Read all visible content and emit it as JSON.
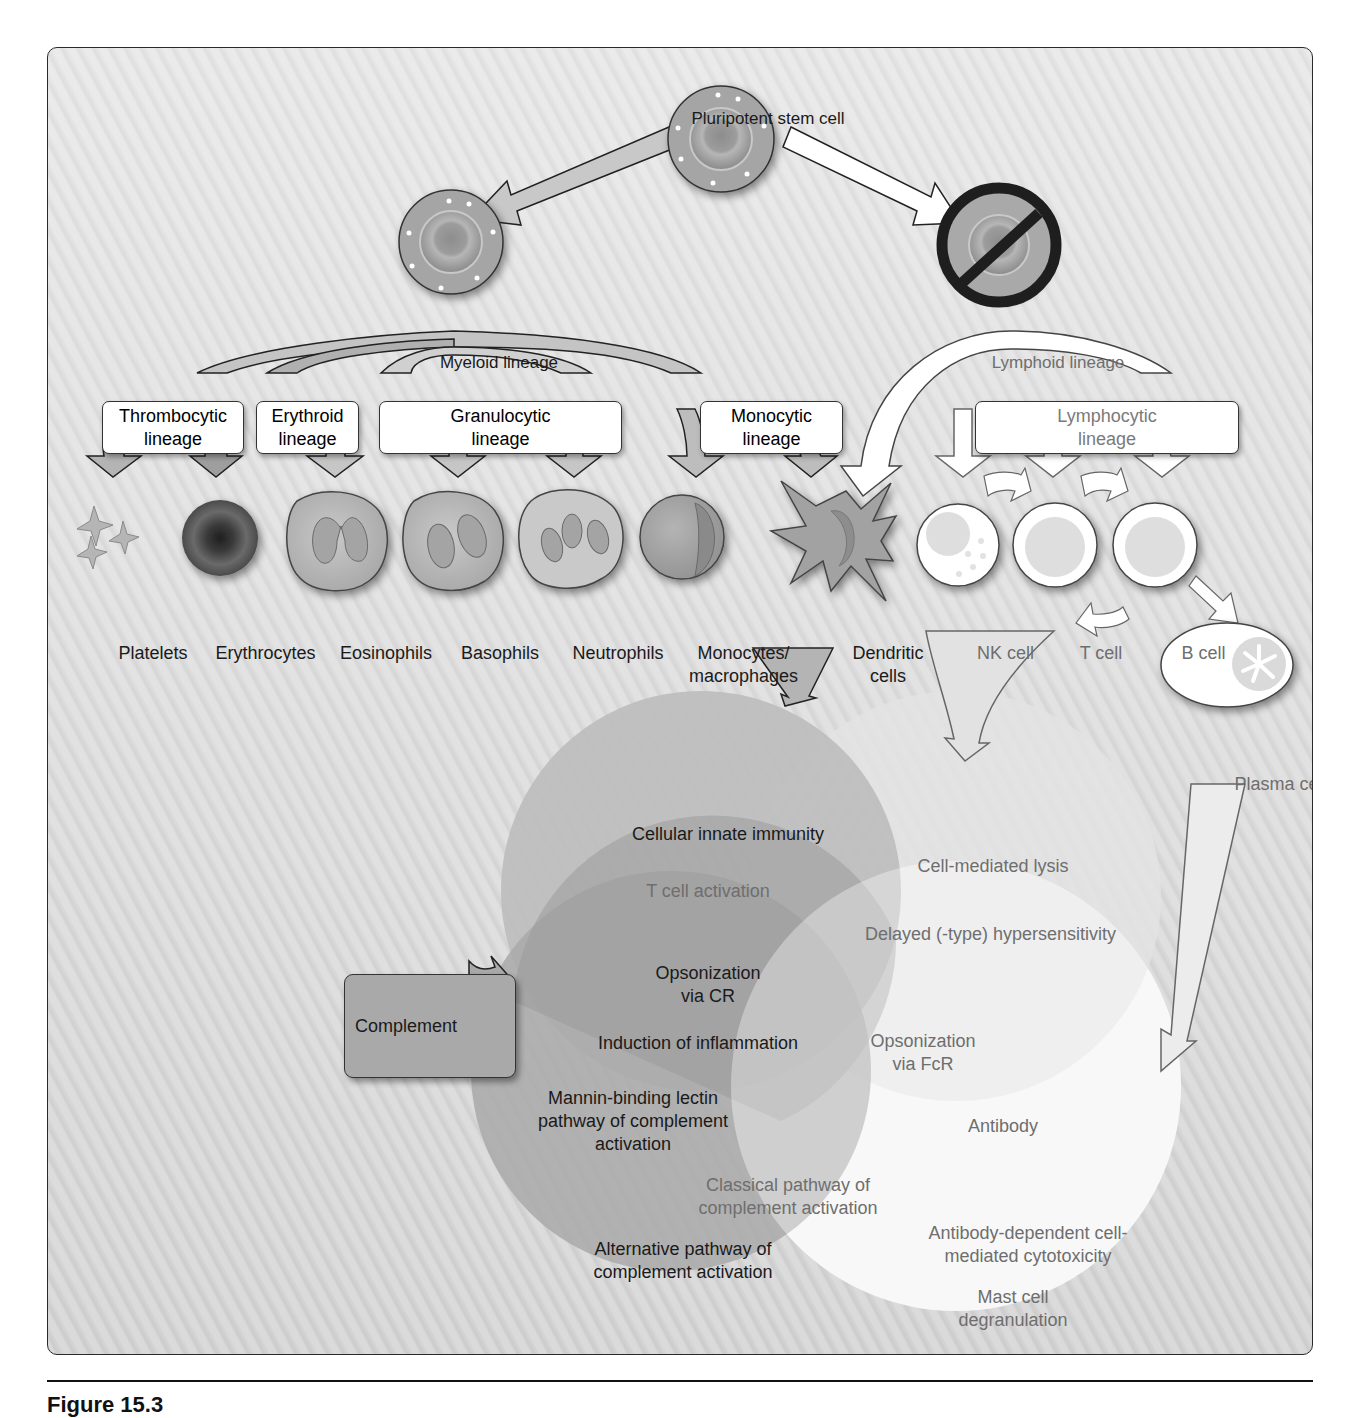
{
  "figure": {
    "caption_partial": "Figure 15.3"
  },
  "stem_cells": {
    "pluripotent": "Pluripotent stem cell",
    "myeloid": "Myeloid lineage",
    "lymphoid": "Lymphoid lineage",
    "lymphoid_blocked": true
  },
  "lineage_boxes": [
    {
      "label": "Thrombocytic\nlineage",
      "group": "myeloid"
    },
    {
      "label": "Erythroid\nlineage",
      "group": "myeloid"
    },
    {
      "label": "Granulocytic\nlineage",
      "group": "myeloid"
    },
    {
      "label": "Monocytic\nlineage",
      "group": "myeloid"
    },
    {
      "label": "Lymphocytic\nlineage",
      "group": "lymphoid"
    }
  ],
  "cells": [
    {
      "label": "Platelets",
      "group": "myeloid"
    },
    {
      "label": "Erythrocytes",
      "group": "myeloid"
    },
    {
      "label": "Eosinophils",
      "group": "myeloid"
    },
    {
      "label": "Basophils",
      "group": "myeloid"
    },
    {
      "label": "Neutrophils",
      "group": "myeloid"
    },
    {
      "label": "Monocytes/\nmacrophages",
      "group": "myeloid"
    },
    {
      "label": "Dendritic\ncells",
      "group": "myeloid"
    },
    {
      "label": "NK cell",
      "group": "lymphoid"
    },
    {
      "label": "T cell",
      "group": "lymphoid"
    },
    {
      "label": "B cell",
      "group": "lymphoid"
    },
    {
      "label": "Plasma cell",
      "group": "lymphoid"
    }
  ],
  "complement": {
    "label": "Complement"
  },
  "venn": {
    "innate_circle": {
      "title": "Cellular innate immunity",
      "items": [
        "T cell activation"
      ]
    },
    "cellular_adaptive_circle": {
      "items": [
        "Cell-mediated lysis",
        "Delayed (-type) hypersensitivity"
      ]
    },
    "complement_circle": {
      "items": [
        "Opsonization\nvia CR",
        "Induction of inflammation",
        "Mannin-binding lectin\npathway of complement\nactivation",
        "Alternative pathway of\ncomplement activation"
      ]
    },
    "humoral_circle": {
      "items": [
        "Opsonization\nvia FcR",
        "Antibody",
        "Classical pathway of\ncomplement activation",
        "Antibody-dependent cell-\nmediated cytotoxicity",
        "Mast cell\ndegranulation"
      ]
    }
  },
  "colors": {
    "panel_bg": "#dcdcdc",
    "innate_circle": "#bdbdbd",
    "complement_circle": "#a9a9a9",
    "overlap_dark": "#9a9a9a",
    "adaptive_cellular": "#e4e4e4",
    "humoral": "#f7f7f7",
    "arrow_myeloid": "#b8b8b8",
    "arrow_lymphoid": "#ffffff",
    "text_dark": "#1a1a1a",
    "text_gray": "#6e6e6e"
  }
}
